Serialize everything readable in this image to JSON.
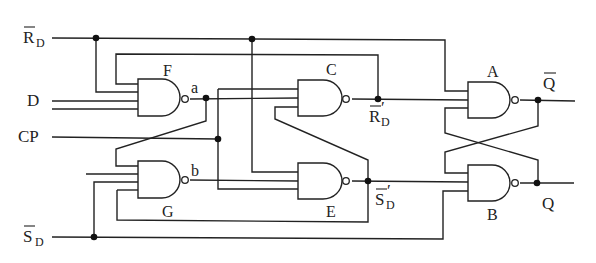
{
  "diagram": {
    "type": "logic-circuit",
    "inputs": {
      "reset": {
        "main": "R",
        "sub": "D",
        "overbar": true
      },
      "data": "D",
      "clock": "CP",
      "set": {
        "main": "S",
        "sub": "D",
        "overbar": true
      }
    },
    "outputs": {
      "q_bar": {
        "main": "Q",
        "overbar": true
      },
      "q": "Q"
    },
    "gates": [
      {
        "id": "A",
        "label": "A",
        "type": "NAND"
      },
      {
        "id": "B",
        "label": "B",
        "type": "NAND"
      },
      {
        "id": "C",
        "label": "C",
        "type": "NAND"
      },
      {
        "id": "E",
        "label": "E",
        "type": "NAND"
      },
      {
        "id": "F",
        "label": "F",
        "type": "NAND"
      },
      {
        "id": "G",
        "label": "G",
        "type": "NAND"
      }
    ],
    "nodes": {
      "a": "a",
      "b": "b",
      "r_prime": {
        "main": "R",
        "sub": "D",
        "prime": "′",
        "overbar": true
      },
      "s_prime": {
        "main": "S",
        "sub": "D",
        "prime": "′",
        "overbar": true
      }
    }
  }
}
